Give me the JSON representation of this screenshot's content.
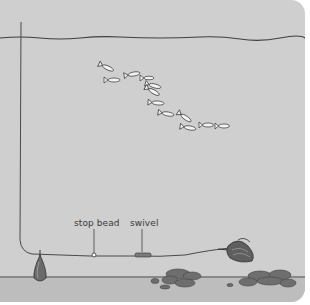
{
  "diagram": {
    "labels": {
      "stop_bead": "stop bead",
      "swivel": "swivel"
    },
    "elements": [
      "water-surface-line",
      "fishing-line",
      "fish-school",
      "sinker-weight",
      "stop-bead",
      "swivel",
      "bait-hook",
      "seabed-rocks"
    ],
    "colors": {
      "water": "#cfcfcf",
      "seabed": "#bdbdbd",
      "line": "#3a3a3a",
      "rock": "#6f6f6f"
    }
  }
}
